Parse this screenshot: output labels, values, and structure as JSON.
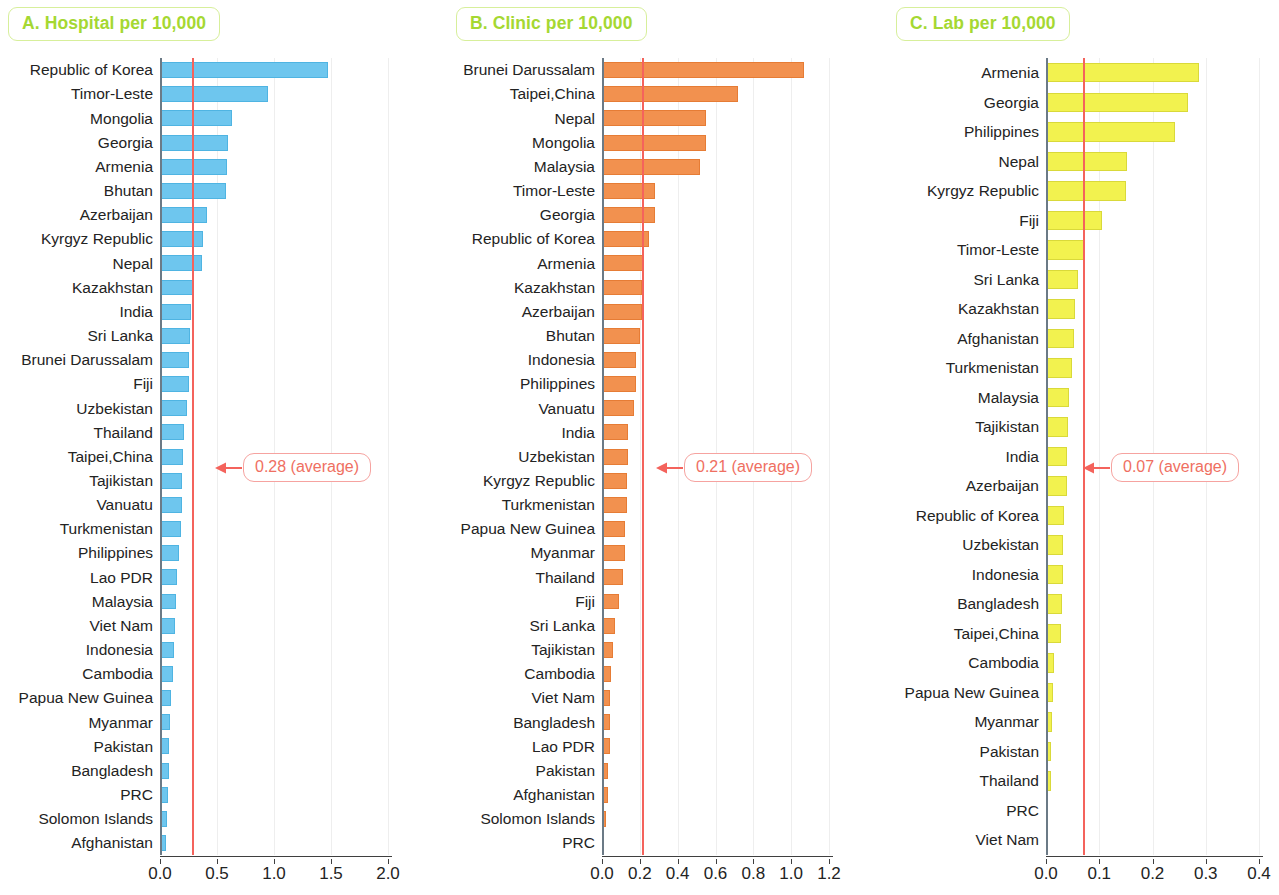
{
  "figure": {
    "panels": [
      {
        "id": "A",
        "title": "A. Hospital per 10,000",
        "bar_color": "#6ec6ee",
        "average_label": "0.28 (average)"
      },
      {
        "id": "B",
        "title": "B. Clinic per 10,000",
        "bar_color": "#f2914f",
        "average_label": "0.21 (average)"
      },
      {
        "id": "C",
        "title": "C. Lab per 10,000",
        "bar_color": "#f2f24f",
        "average_label": "0.07 (average)"
      }
    ],
    "average_line_color": "#f4635c",
    "title_color": "#a5d832"
  },
  "chart_data": [
    {
      "type": "bar",
      "orientation": "horizontal",
      "title": "A. Hospital per 10,000",
      "xlabel": "",
      "ylabel": "",
      "xlim": [
        0,
        2.0
      ],
      "xticks": [
        "0.0",
        "0.5",
        "1.0",
        "1.5",
        "2.0"
      ],
      "xtick_values": [
        0.0,
        0.5,
        1.0,
        1.5,
        2.0
      ],
      "grid": true,
      "legend": "none",
      "annotation": {
        "label": "0.28 (average)",
        "value": 0.28
      },
      "categories": [
        "Republic of Korea",
        "Timor-Leste",
        "Mongolia",
        "Georgia",
        "Armenia",
        "Bhutan",
        "Azerbaijan",
        "Kyrgyz Republic",
        "Nepal",
        "Kazakhstan",
        "India",
        "Sri Lanka",
        "Brunei Darussalam",
        "Fiji",
        "Uzbekistan",
        "Thailand",
        "Taipei,China",
        "Tajikistan",
        "Vanuatu",
        "Turkmenistan",
        "Philippines",
        "Lao PDR",
        "Malaysia",
        "Viet Nam",
        "Indonesia",
        "Cambodia",
        "Papua New Guinea",
        "Myanmar",
        "Pakistan",
        "Bangladesh",
        "PRC",
        "Solomon Islands",
        "Afghanistan"
      ],
      "values": [
        1.47,
        0.95,
        0.63,
        0.6,
        0.59,
        0.58,
        0.41,
        0.38,
        0.37,
        0.29,
        0.27,
        0.26,
        0.25,
        0.25,
        0.24,
        0.21,
        0.2,
        0.19,
        0.19,
        0.18,
        0.17,
        0.15,
        0.14,
        0.13,
        0.12,
        0.11,
        0.1,
        0.09,
        0.08,
        0.08,
        0.07,
        0.06,
        0.05
      ]
    },
    {
      "type": "bar",
      "orientation": "horizontal",
      "title": "B. Clinic per 10,000",
      "xlabel": "",
      "ylabel": "",
      "xlim": [
        0,
        1.2
      ],
      "xticks": [
        "0.0",
        "0.2",
        "0.4",
        "0.6",
        "0.8",
        "1.0",
        "1.2"
      ],
      "xtick_values": [
        0.0,
        0.2,
        0.4,
        0.6,
        0.8,
        1.0,
        1.2
      ],
      "grid": true,
      "legend": "none",
      "annotation": {
        "label": "0.21 (average)",
        "value": 0.21
      },
      "categories": [
        "Brunei Darussalam",
        "Taipei,China",
        "Nepal",
        "Mongolia",
        "Malaysia",
        "Timor-Leste",
        "Georgia",
        "Republic of Korea",
        "Armenia",
        "Kazakhstan",
        "Azerbaijan",
        "Bhutan",
        "Indonesia",
        "Philippines",
        "Vanuatu",
        "India",
        "Uzbekistan",
        "Kyrgyz Republic",
        "Turkmenistan",
        "Papua New Guinea",
        "Myanmar",
        "Thailand",
        "Fiji",
        "Sri Lanka",
        "Tajikistan",
        "Cambodia",
        "Viet Nam",
        "Bangladesh",
        "Lao PDR",
        "Pakistan",
        "Afghanistan",
        "Solomon Islands",
        "PRC"
      ],
      "values": [
        1.07,
        0.72,
        0.55,
        0.55,
        0.52,
        0.28,
        0.28,
        0.25,
        0.22,
        0.21,
        0.21,
        0.2,
        0.18,
        0.18,
        0.17,
        0.14,
        0.14,
        0.13,
        0.13,
        0.12,
        0.12,
        0.11,
        0.09,
        0.07,
        0.06,
        0.05,
        0.04,
        0.04,
        0.04,
        0.03,
        0.03,
        0.02,
        0.01
      ]
    },
    {
      "type": "bar",
      "orientation": "horizontal",
      "title": "C. Lab per 10,000",
      "xlabel": "",
      "ylabel": "",
      "xlim": [
        0,
        0.4
      ],
      "xticks": [
        "0.0",
        "0.1",
        "0.2",
        "0.3",
        "0.4"
      ],
      "xtick_values": [
        0.0,
        0.1,
        0.2,
        0.3,
        0.4
      ],
      "grid": true,
      "legend": "none",
      "annotation": {
        "label": "0.07 (average)",
        "value": 0.07
      },
      "categories": [
        "Armenia",
        "Georgia",
        "Philippines",
        "Nepal",
        "Kyrgyz Republic",
        "Fiji",
        "Timor-Leste",
        "Sri Lanka",
        "Kazakhstan",
        "Afghanistan",
        "Turkmenistan",
        "Malaysia",
        "Tajikistan",
        "India",
        "Azerbaijan",
        "Republic of Korea",
        "Uzbekistan",
        "Indonesia",
        "Bangladesh",
        "Taipei,China",
        "Cambodia",
        "Papua New Guinea",
        "Myanmar",
        "Pakistan",
        "Thailand",
        "PRC",
        "Viet Nam"
      ],
      "values": [
        0.287,
        0.267,
        0.242,
        0.153,
        0.15,
        0.105,
        0.073,
        0.06,
        0.055,
        0.053,
        0.048,
        0.043,
        0.042,
        0.04,
        0.039,
        0.034,
        0.032,
        0.031,
        0.03,
        0.029,
        0.015,
        0.013,
        0.011,
        0.01,
        0.009,
        0.003,
        0.001
      ]
    }
  ]
}
